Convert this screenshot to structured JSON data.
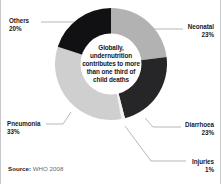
{
  "chart_data": {
    "type": "pie",
    "variant": "donut",
    "title": "",
    "subtitle": "",
    "xlabel": "",
    "ylabel": "",
    "units": "percent",
    "start_angle_deg": 0,
    "direction": "clockwise",
    "legend_position": "callout-labels",
    "grid": false,
    "categories": [
      "Neonatal",
      "Diarrhoea",
      "Injuries",
      "Pneumonia",
      "Others"
    ],
    "values": [
      23,
      23,
      1,
      33,
      20
    ],
    "slices": [
      {
        "label": "Neonatal",
        "value": 23,
        "value_text": "23%",
        "color": "#b2b2b2",
        "start_deg": 0.0,
        "end_deg": 82.8
      },
      {
        "label": "Diarrhoea",
        "value": 23,
        "value_text": "23%",
        "color": "#262628",
        "start_deg": 82.8,
        "end_deg": 165.6
      },
      {
        "label": "Injuries",
        "value": 1,
        "value_text": "1%",
        "color": "#f2f2f2",
        "start_deg": 165.6,
        "end_deg": 169.2
      },
      {
        "label": "Pneumonia",
        "value": 33,
        "value_text": "33%",
        "color": "#cfcfcf",
        "start_deg": 169.2,
        "end_deg": 288.0
      },
      {
        "label": "Others",
        "value": 20,
        "value_text": "20%",
        "color": "#111113",
        "start_deg": 288.0,
        "end_deg": 360.0
      }
    ],
    "annotation": "Globally, undernutrition contributes to more than one third of child deaths",
    "source_text": "WHO 2008"
  },
  "center": {
    "lines": [
      "Globally,",
      "undernutrition",
      "contributes to more",
      "than one third of",
      "child deaths"
    ]
  },
  "labels": {
    "others": {
      "name": "Others",
      "pct": "20%"
    },
    "pneumonia": {
      "name": "Pneumonia",
      "pct": "33%"
    },
    "neonatal": {
      "name": "Neonatal",
      "pct": "23%"
    },
    "diarrhoea": {
      "name": "Diarrhoea",
      "pct": "23%"
    },
    "injuries": {
      "name": "Injuries",
      "pct": "1%"
    }
  },
  "source": {
    "label": "Source:",
    "value": "WHO 2008"
  }
}
